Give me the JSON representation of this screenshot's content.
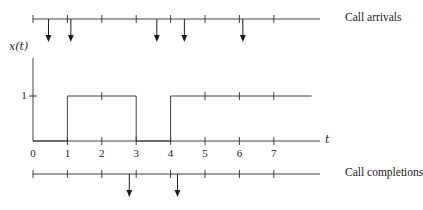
{
  "figure": {
    "title": "",
    "arrivals_label": "Call arrivals",
    "completions_label": "Call completions",
    "signal_label": "x(t)",
    "time_axis_label": "t",
    "amplitude_tick_label": "1"
  },
  "chart_data": {
    "type": "line",
    "title": "",
    "xlabel": "t",
    "ylabel": "x(t)",
    "xlim": [
      0,
      8.1
    ],
    "ylim": [
      0,
      1.45
    ],
    "grid": false,
    "legend": "none",
    "xticks": [
      0,
      1,
      2,
      3,
      4,
      5,
      6,
      7
    ],
    "xtick_labels": [
      "0",
      "1",
      "2",
      "3",
      "4",
      "5",
      "6",
      "7"
    ],
    "yticks": [
      1
    ],
    "ytick_labels": [
      "1"
    ],
    "series": [
      {
        "name": "x(t)",
        "type": "step",
        "x": [
          0,
          1,
          1,
          3,
          3,
          4,
          4,
          8.1
        ],
        "values": [
          0,
          0,
          1,
          1,
          0,
          0,
          1,
          1
        ]
      }
    ],
    "pulses": [
      {
        "start": 1,
        "end": 3,
        "height": 1
      },
      {
        "start": 4,
        "end": 8.1,
        "height": 1
      }
    ],
    "event_lines": [
      {
        "name": "Call arrivals",
        "label": "Call arrivals",
        "ticks": [
          0,
          1,
          2,
          3,
          4,
          5,
          6,
          7
        ],
        "events": [
          0.45,
          1.1,
          3.6,
          4.4,
          6.1
        ],
        "marker": "down-arrow"
      },
      {
        "name": "Call completions",
        "label": "Call completions",
        "ticks": [
          0,
          1,
          2,
          3,
          4,
          5,
          6,
          7
        ],
        "events": [
          2.8,
          4.2
        ],
        "marker": "down-arrow"
      }
    ]
  }
}
